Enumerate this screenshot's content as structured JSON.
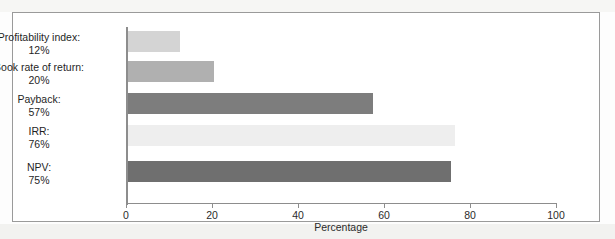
{
  "figure": {
    "frame_border_color": "#9a9a9a",
    "page_background": "#fdfdfd"
  },
  "chart_data": {
    "type": "bar",
    "orientation": "horizontal",
    "title": "",
    "subtitle": "",
    "xlabel": "Percentage",
    "ylabel": "",
    "xlim": [
      0,
      100
    ],
    "ylim": [
      0,
      5
    ],
    "grid": false,
    "legend": null,
    "legend_position": "none",
    "xticks": [
      0,
      20,
      40,
      60,
      80,
      100
    ],
    "xticklabels": [
      "0",
      "20",
      "40",
      "60",
      "80",
      "100"
    ],
    "categories": [
      "Profitability index:",
      "Book rate of return:",
      "Payback:",
      "IRR:",
      "NPV:"
    ],
    "value_labels": [
      "12%",
      "20%",
      "57%",
      "76%",
      "75%"
    ],
    "values": [
      12,
      20,
      57,
      76,
      75
    ],
    "bar_colors": [
      "#d4d4d4",
      "#b0b0b0",
      "#7d7d7d",
      "#eeeeee",
      "#6f6f6f"
    ],
    "bars": [
      {
        "category": "Profitability index:",
        "value_label": "12%",
        "value": 12,
        "color": "#d4d4d4"
      },
      {
        "category": "Book rate of return:",
        "value_label": "20%",
        "value": 20,
        "color": "#b0b0b0"
      },
      {
        "category": "Payback:",
        "value_label": "57%",
        "value": 57,
        "color": "#7d7d7d"
      },
      {
        "category": "IRR:",
        "value_label": "76%",
        "value": 76,
        "color": "#eeeeee"
      },
      {
        "category": "NPV:",
        "value_label": "75%",
        "value": 75,
        "color": "#6f6f6f"
      }
    ]
  }
}
